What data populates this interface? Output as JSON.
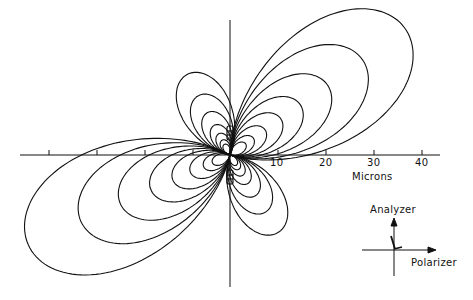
{
  "figure": {
    "origin": {
      "x": 230,
      "y": 155
    },
    "scale_px_per_micron": 4.8,
    "axis_label": "Microns",
    "ticks": [
      {
        "value": 10,
        "label": "10"
      },
      {
        "value": 20,
        "label": "20"
      },
      {
        "value": 30,
        "label": "30"
      },
      {
        "value": 40,
        "label": "40"
      }
    ],
    "left_ticks": [
      -40,
      -30,
      -20,
      -10
    ],
    "lobe_groups": [
      {
        "name": "upper-right",
        "angle_deg": 36,
        "lengths": [
          45,
          34,
          25,
          18,
          13,
          9,
          6,
          4
        ]
      },
      {
        "name": "lower-left",
        "angle_deg": 204,
        "lengths": [
          46,
          34,
          25,
          18,
          13,
          9,
          6,
          4
        ]
      },
      {
        "name": "upper-left",
        "angle_deg": 118,
        "lengths": [
          19,
          14,
          10,
          7,
          5,
          3.5,
          2.5
        ]
      },
      {
        "name": "lower-right",
        "angle_deg": 302,
        "lengths": [
          19,
          14,
          10,
          7,
          5,
          3.5,
          2.5
        ]
      }
    ],
    "line_color": "#111111",
    "background": "#ffffff"
  },
  "legend": {
    "analyzer_label": "Analyzer",
    "polarizer_label": "Polarizer"
  }
}
